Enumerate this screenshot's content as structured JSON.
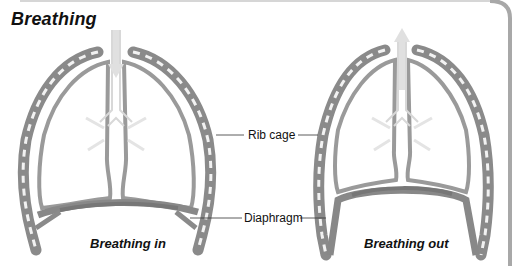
{
  "title": "Breathing",
  "labels": {
    "rib_cage": "Rib cage",
    "diaphragm": "Diaphragm"
  },
  "panels": [
    {
      "caption": "Breathing in",
      "airflow": "down-arrow"
    },
    {
      "caption": "Breathing out",
      "airflow": "up-arrow"
    }
  ],
  "colors": {
    "rib": "#8a8a8a",
    "rib_light": "#f4f4f4",
    "lung_outline": "#9a9a9a",
    "airflow": "#e2e2e2",
    "frame": "#a8a8a8",
    "text": "#111111"
  }
}
